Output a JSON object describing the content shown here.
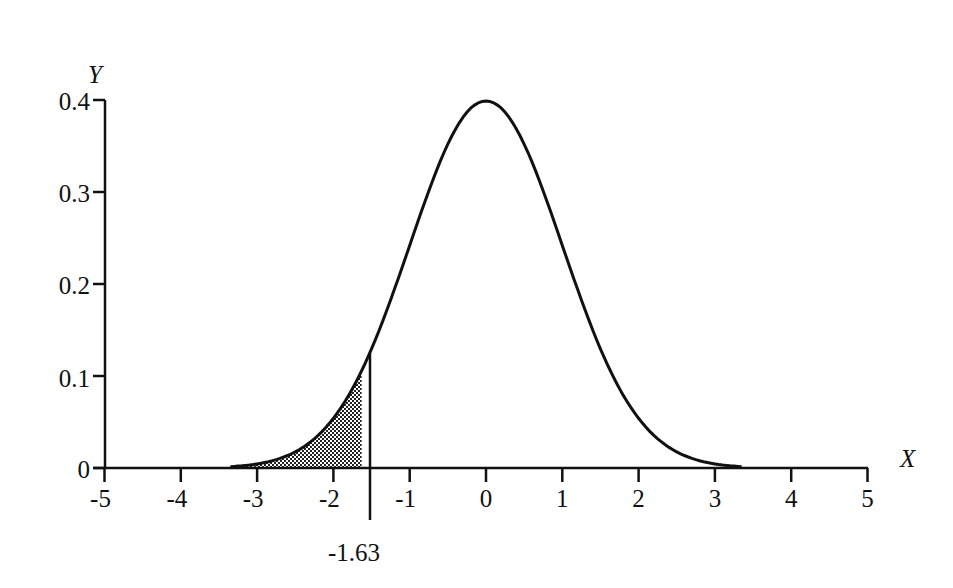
{
  "chart_data": {
    "type": "line",
    "title": "",
    "xlabel": "X",
    "ylabel": "Y",
    "xlim": [
      -5,
      5
    ],
    "ylim": [
      0,
      0.4
    ],
    "x_ticks": [
      "-5",
      "-4",
      "-3",
      "-2",
      "-1",
      "0",
      "1",
      "2",
      "3",
      "4",
      "5"
    ],
    "y_ticks": [
      "0",
      "0.1",
      "0.2",
      "0.3",
      "0.4"
    ],
    "grid": false,
    "legend": null,
    "series": [
      {
        "name": "Standard normal density",
        "x": [
          -3.3,
          -3,
          -2.5,
          -2,
          -1.63,
          -1.5,
          -1,
          -0.5,
          0,
          0.5,
          1,
          1.5,
          2,
          2.5,
          3,
          3.3
        ],
        "values": [
          0.002,
          0.004,
          0.018,
          0.054,
          0.106,
          0.13,
          0.242,
          0.352,
          0.399,
          0.352,
          0.242,
          0.13,
          0.054,
          0.018,
          0.004,
          0.002
        ]
      }
    ],
    "shaded_region": {
      "from": -5,
      "to": -1.63,
      "description": "left tail area under curve"
    },
    "annotations": [
      {
        "text": "-1.63",
        "x": -1.63,
        "position": "below axis, marked by vertical line"
      }
    ]
  },
  "labels": {
    "y_axis_title": "Y",
    "x_axis_title": "X",
    "cutoff_label": "-1.63",
    "y_ticks": [
      "0.4",
      "0.3",
      "0.2",
      "0.1",
      "0"
    ],
    "x_ticks": [
      "-5",
      "-4",
      "-3",
      "-2",
      "-1",
      "0",
      "1",
      "2",
      "3",
      "4",
      "5"
    ]
  }
}
